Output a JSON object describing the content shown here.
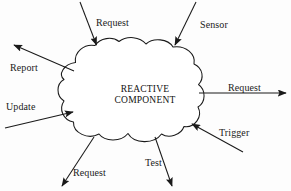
{
  "diagram": {
    "type": "data-flow-cloud-diagram",
    "background_color": "#fdfdfd",
    "stroke_color": "#1a1a1a",
    "node": {
      "shape": "cloud",
      "label_line1": "REACTIVE",
      "label_line2": "COMPONENT"
    },
    "flows": [
      {
        "id": "request-in-top",
        "label": "Request",
        "direction": "inbound",
        "origin": "top-left-above",
        "label_x": 96,
        "label_y": 18
      },
      {
        "id": "sensor-in-top",
        "label": "Sensor",
        "direction": "inbound",
        "origin": "top-right-above",
        "label_x": 200,
        "label_y": 20
      },
      {
        "id": "report-out-left",
        "label": "Report",
        "direction": "outbound",
        "origin": "upper-left",
        "label_x": 10,
        "label_y": 63
      },
      {
        "id": "update-in-left",
        "label": "Update",
        "direction": "inbound",
        "origin": "lower-left",
        "label_x": 6,
        "label_y": 102
      },
      {
        "id": "request-out-right",
        "label": "Request",
        "direction": "outbound",
        "origin": "right",
        "label_x": 228,
        "label_y": 83
      },
      {
        "id": "trigger-in-right",
        "label": "Trigger",
        "direction": "inbound",
        "origin": "lower-right",
        "label_x": 219,
        "label_y": 128
      },
      {
        "id": "request-out-bottom-left",
        "label": "Request",
        "direction": "outbound",
        "origin": "bottom-left",
        "label_x": 73,
        "label_y": 168
      },
      {
        "id": "test-out-bottom",
        "label": "Test",
        "direction": "outbound",
        "origin": "bottom-center",
        "label_x": 145,
        "label_y": 158
      }
    ]
  }
}
